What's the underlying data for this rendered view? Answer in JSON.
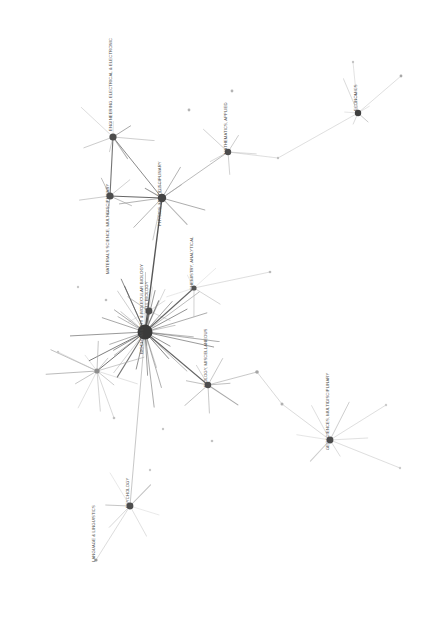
{
  "view": {
    "title": "Science map co-citation network",
    "background_color": "#ffffff",
    "width": 439,
    "height": 629,
    "label_color": "#4a4a4a",
    "node_color": "#5a5a5a",
    "edge_color": "#888888"
  },
  "chart_data": {
    "type": "scatter",
    "title": "",
    "xlabel": "",
    "ylabel": "",
    "xlim": [
      0,
      439
    ],
    "ylim": [
      0,
      629
    ],
    "grid": false,
    "legend": "none",
    "nodes": [
      {
        "label": "ENGINEERING, ELECTRICAL & ELECTRONIC",
        "x": 113,
        "y": 137,
        "r": 3.6,
        "color": "#4d4d4d",
        "label_rotation": -90,
        "label_size": 4.2,
        "label_dx": -5,
        "label_dy": -6
      },
      {
        "label": "MATERIALS SCIENCE, MULTIDISCIPLINARY",
        "x": 110,
        "y": 196,
        "r": 3.6,
        "color": "#4d4d4d",
        "label_rotation": -90,
        "label_size": 4.2,
        "label_dx": -5,
        "label_dy": 78
      },
      {
        "label": "PHYSICS, MULTIDISCIPLINARY",
        "x": 162,
        "y": 198,
        "r": 4.2,
        "color": "#444444",
        "label_rotation": -90,
        "label_size": 4.2,
        "label_dx": -5,
        "label_dy": 28
      },
      {
        "label": "MATHEMATICS, APPLIED",
        "x": 228,
        "y": 152,
        "r": 3.2,
        "color": "#4d4d4d",
        "label_rotation": -90,
        "label_size": 4.2,
        "label_dx": -5,
        "label_dy": 2
      },
      {
        "label": "ECONOMICS",
        "x": 358,
        "y": 113,
        "r": 3.2,
        "color": "#3f3f3f",
        "label_rotation": -90,
        "label_size": 4.2,
        "label_dx": -5,
        "label_dy": -2
      },
      {
        "label": "CELL BIOLOGY",
        "x": 149,
        "y": 311,
        "r": 3.4,
        "color": "#4d4d4d",
        "label_rotation": -90,
        "label_size": 4.2,
        "label_dx": -5,
        "label_dy": 2
      },
      {
        "label": "BIOCHEMISTRY & MOLECULAR BIOLOGY",
        "x": 145,
        "y": 332,
        "r": 7.5,
        "color": "#3a3a3a",
        "label_rotation": -90,
        "label_size": 4.4,
        "label_dx": -6,
        "label_dy": 22
      },
      {
        "label": "CHEMISTRY, ANALYTICAL",
        "x": 194,
        "y": 288,
        "r": 2.6,
        "color": "#555555",
        "label_rotation": -90,
        "label_size": 4.2,
        "label_dx": -5,
        "label_dy": 2
      },
      {
        "label": "BIOLOGY, MISCELLANEOUS",
        "x": 208,
        "y": 385,
        "r": 3.2,
        "color": "#4d4d4d",
        "label_rotation": -90,
        "label_size": 4.2,
        "label_dx": -5,
        "label_dy": 2
      },
      {
        "label": "GEOSCIENCES, MULTIDISCIPLINARY",
        "x": 330,
        "y": 440,
        "r": 3.4,
        "color": "#4d4d4d",
        "label_rotation": -90,
        "label_size": 4.2,
        "label_dx": -5,
        "label_dy": 10
      },
      {
        "label": "PSYCHOLOGY",
        "x": 130,
        "y": 506,
        "r": 3.4,
        "color": "#4d4d4d",
        "label_rotation": -90,
        "label_size": 4.2,
        "label_dx": -5,
        "label_dy": 2
      },
      {
        "label": "LANGUAGE & LINGUISTICS",
        "x": 96,
        "y": 560,
        "r": 1.6,
        "color": "#9a9a9a",
        "label_rotation": -90,
        "label_size": 4.2,
        "label_dx": -5,
        "label_dy": 2
      }
    ],
    "minor_nodes": [
      {
        "x": 189,
        "y": 110,
        "r": 1.4,
        "color": "#b4b4b4"
      },
      {
        "x": 232,
        "y": 91,
        "r": 1.4,
        "color": "#b4b4b4"
      },
      {
        "x": 278,
        "y": 158,
        "r": 1.2,
        "color": "#c0c0c0"
      },
      {
        "x": 401,
        "y": 76,
        "r": 1.4,
        "color": "#a8a8a8"
      },
      {
        "x": 353,
        "y": 62,
        "r": 1.2,
        "color": "#c4c4c4"
      },
      {
        "x": 270,
        "y": 272,
        "r": 1.3,
        "color": "#bbbbbb"
      },
      {
        "x": 106,
        "y": 300,
        "r": 1.3,
        "color": "#bdbdbd"
      },
      {
        "x": 97,
        "y": 371,
        "r": 2.6,
        "color": "#8d8d8d"
      },
      {
        "x": 257,
        "y": 372,
        "r": 1.8,
        "color": "#a5a5a5"
      },
      {
        "x": 282,
        "y": 404,
        "r": 1.5,
        "color": "#b0b0b0"
      },
      {
        "x": 212,
        "y": 441,
        "r": 1.3,
        "color": "#c2c2c2"
      },
      {
        "x": 163,
        "y": 429,
        "r": 1.2,
        "color": "#c6c6c6"
      },
      {
        "x": 114,
        "y": 418,
        "r": 1.3,
        "color": "#c0c0c0"
      },
      {
        "x": 58,
        "y": 352,
        "r": 1.2,
        "color": "#c8c8c8"
      },
      {
        "x": 78,
        "y": 287,
        "r": 1.2,
        "color": "#c8c8c8"
      },
      {
        "x": 386,
        "y": 405,
        "r": 1.2,
        "color": "#cbcbcb"
      },
      {
        "x": 400,
        "y": 468,
        "r": 1.2,
        "color": "#cbcbcb"
      },
      {
        "x": 150,
        "y": 470,
        "r": 1.2,
        "color": "#c9c9c9"
      }
    ],
    "edges": [
      {
        "x1": 113,
        "y1": 137,
        "x2": 110,
        "y2": 196,
        "w": 1.1,
        "color": "#6d6d6d"
      },
      {
        "x1": 110,
        "y1": 196,
        "x2": 162,
        "y2": 198,
        "w": 1.2,
        "color": "#5f5f5f"
      },
      {
        "x1": 113,
        "y1": 137,
        "x2": 162,
        "y2": 198,
        "w": 0.9,
        "color": "#777777"
      },
      {
        "x1": 162,
        "y1": 198,
        "x2": 228,
        "y2": 152,
        "w": 0.7,
        "color": "#9a9a9a"
      },
      {
        "x1": 162,
        "y1": 198,
        "x2": 145,
        "y2": 332,
        "w": 1.4,
        "color": "#4f4f4f"
      },
      {
        "x1": 145,
        "y1": 332,
        "x2": 149,
        "y2": 311,
        "w": 1.3,
        "color": "#525252"
      },
      {
        "x1": 145,
        "y1": 332,
        "x2": 194,
        "y2": 288,
        "w": 1.1,
        "color": "#5e5e5e"
      },
      {
        "x1": 145,
        "y1": 332,
        "x2": 208,
        "y2": 385,
        "w": 1.1,
        "color": "#5e5e5e"
      },
      {
        "x1": 145,
        "y1": 332,
        "x2": 97,
        "y2": 371,
        "w": 1.0,
        "color": "#6a6a6a"
      },
      {
        "x1": 208,
        "y1": 385,
        "x2": 257,
        "y2": 372,
        "w": 0.6,
        "color": "#a0a0a0"
      },
      {
        "x1": 257,
        "y1": 372,
        "x2": 282,
        "y2": 404,
        "w": 0.5,
        "color": "#b0b0b0"
      },
      {
        "x1": 282,
        "y1": 404,
        "x2": 330,
        "y2": 440,
        "w": 0.5,
        "color": "#b4b4b4"
      },
      {
        "x1": 330,
        "y1": 440,
        "x2": 386,
        "y2": 405,
        "w": 0.5,
        "color": "#bbbbbb"
      },
      {
        "x1": 330,
        "y1": 440,
        "x2": 400,
        "y2": 468,
        "w": 0.5,
        "color": "#bbbbbb"
      },
      {
        "x1": 145,
        "y1": 332,
        "x2": 130,
        "y2": 506,
        "w": 0.6,
        "color": "#9e9e9e"
      },
      {
        "x1": 130,
        "y1": 506,
        "x2": 96,
        "y2": 560,
        "w": 0.5,
        "color": "#b6b6b6"
      },
      {
        "x1": 228,
        "y1": 152,
        "x2": 278,
        "y2": 158,
        "w": 0.5,
        "color": "#bdbdbd"
      },
      {
        "x1": 278,
        "y1": 158,
        "x2": 358,
        "y2": 113,
        "w": 0.5,
        "color": "#bdbdbd"
      },
      {
        "x1": 358,
        "y1": 113,
        "x2": 401,
        "y2": 76,
        "w": 0.5,
        "color": "#bdbdbd"
      },
      {
        "x1": 358,
        "y1": 113,
        "x2": 353,
        "y2": 62,
        "w": 0.5,
        "color": "#c4c4c4"
      },
      {
        "x1": 194,
        "y1": 288,
        "x2": 270,
        "y2": 272,
        "w": 0.5,
        "color": "#bbbbbb"
      },
      {
        "x1": 97,
        "y1": 371,
        "x2": 114,
        "y2": 418,
        "w": 0.5,
        "color": "#b0b0b0"
      },
      {
        "x1": 97,
        "y1": 371,
        "x2": 58,
        "y2": 352,
        "w": 0.5,
        "color": "#bdbdbd"
      }
    ],
    "hub_spokes": [
      {
        "x": 145,
        "y": 332,
        "count": 34,
        "length_min": 26,
        "length_max": 78,
        "color": "#5a5a5a"
      },
      {
        "x": 162,
        "y": 198,
        "count": 9,
        "length_min": 18,
        "length_max": 46,
        "color": "#8e8e8e"
      },
      {
        "x": 97,
        "y": 371,
        "count": 11,
        "length_min": 16,
        "length_max": 52,
        "color": "#a8a8a8"
      },
      {
        "x": 208,
        "y": 385,
        "count": 7,
        "length_min": 14,
        "length_max": 40,
        "color": "#a0a0a0"
      },
      {
        "x": 113,
        "y": 137,
        "count": 7,
        "length_min": 14,
        "length_max": 44,
        "color": "#a2a2a2"
      },
      {
        "x": 110,
        "y": 196,
        "count": 5,
        "length_min": 14,
        "length_max": 46,
        "color": "#a2a2a2"
      },
      {
        "x": 330,
        "y": 440,
        "count": 6,
        "length_min": 14,
        "length_max": 46,
        "color": "#b8b8b8"
      },
      {
        "x": 130,
        "y": 506,
        "count": 6,
        "length_min": 14,
        "length_max": 44,
        "color": "#b0b0b0"
      },
      {
        "x": 228,
        "y": 152,
        "count": 5,
        "length_min": 12,
        "length_max": 34,
        "color": "#bbbbbb"
      },
      {
        "x": 149,
        "y": 311,
        "count": 6,
        "length_min": 12,
        "length_max": 36,
        "color": "#9a9a9a"
      },
      {
        "x": 194,
        "y": 288,
        "count": 5,
        "length_min": 12,
        "length_max": 34,
        "color": "#bcbcbc"
      },
      {
        "x": 358,
        "y": 113,
        "count": 5,
        "length_min": 12,
        "length_max": 40,
        "color": "#b4b4b4"
      }
    ]
  }
}
